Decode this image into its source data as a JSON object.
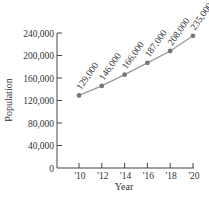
{
  "chart_data": {
    "type": "line",
    "title": "",
    "xlabel": "Year",
    "ylabel": "Population",
    "categories": [
      "'10",
      "'12",
      "'14",
      "'16",
      "'18",
      "'20"
    ],
    "x": [
      2010,
      2012,
      2014,
      2016,
      2018,
      2020
    ],
    "series": [
      {
        "name": "Population",
        "x": [
          2010,
          2012,
          2014,
          2016,
          2018,
          2020
        ],
        "values": [
          129000,
          146000,
          166000,
          187000,
          208000,
          235000
        ],
        "labels": [
          "129,000",
          "146,000",
          "166,000",
          "187,000",
          "208,000",
          "235,000"
        ]
      }
    ],
    "yticks": [
      0,
      40000,
      80000,
      120000,
      160000,
      200000,
      240000
    ],
    "ytick_labels": [
      "0",
      "40,000",
      "80,000",
      "120,000",
      "160,000",
      "200,000",
      "240,000"
    ],
    "ylim": [
      0,
      240000
    ],
    "grid": false,
    "legend": "none",
    "colors": {
      "line": "#999999",
      "marker": "#777777",
      "axis": "#444444"
    }
  }
}
